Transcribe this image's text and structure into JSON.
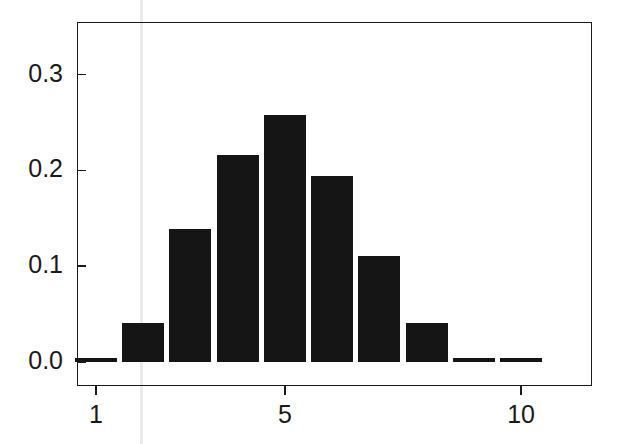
{
  "chart_data": {
    "type": "bar",
    "title": "",
    "subtitle": "",
    "xlabel": "",
    "ylabel": "",
    "categories": [
      "1",
      "2",
      "3",
      "4",
      "5",
      "6",
      "7",
      "8",
      "9",
      "10"
    ],
    "values": [
      0.004,
      0.041,
      0.139,
      0.216,
      0.258,
      0.194,
      0.111,
      0.041,
      0.004,
      0.0
    ],
    "series": [
      {
        "name": "frequency",
        "values": [
          0.004,
          0.041,
          0.139,
          0.216,
          0.258,
          0.194,
          0.111,
          0.041,
          0.004,
          0.0
        ]
      }
    ],
    "x": [
      1,
      2,
      3,
      4,
      5,
      6,
      7,
      8,
      9,
      10
    ],
    "xlim": [
      0.6,
      11.5
    ],
    "ylim": [
      -0.025,
      0.355
    ],
    "yticks": [
      0.0,
      0.1,
      0.2,
      0.3
    ],
    "ytick_labels": [
      "0.0",
      "0.1",
      "0.2",
      "0.3"
    ],
    "xticks": [
      1,
      5,
      10
    ],
    "xtick_labels": [
      "1",
      "5",
      "10"
    ],
    "grid": false,
    "legend": null,
    "bar_color": "#151515",
    "axis_color": "#1a1a1a",
    "background_color": "#ffffff",
    "annotations": []
  },
  "axes": {
    "y": {
      "ticks": [
        {
          "label": "0.0",
          "value": 0.0
        },
        {
          "label": "0.1",
          "value": 0.1
        },
        {
          "label": "0.2",
          "value": 0.2
        },
        {
          "label": "0.3",
          "value": 0.3
        }
      ]
    },
    "x": {
      "ticks": [
        {
          "label": "1",
          "value": 1
        },
        {
          "label": "5",
          "value": 5
        },
        {
          "label": "10",
          "value": 10
        }
      ]
    }
  }
}
